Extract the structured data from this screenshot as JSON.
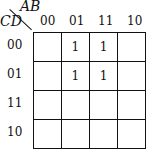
{
  "kmap": {
    "col_var": "AB",
    "row_var": "CD",
    "col_labels": [
      "00",
      "01",
      "11",
      "10"
    ],
    "row_labels": [
      "00",
      "01",
      "11",
      "10"
    ],
    "cells": [
      [
        "",
        "1",
        "1",
        ""
      ],
      [
        "",
        "1",
        "1",
        ""
      ],
      [
        "",
        "",
        "",
        ""
      ],
      [
        "",
        "",
        "",
        ""
      ]
    ]
  }
}
